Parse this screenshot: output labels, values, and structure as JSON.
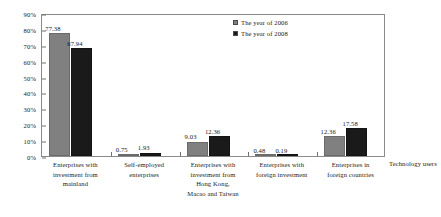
{
  "chart_data": {
    "type": "bar",
    "title": "",
    "subtitle": "",
    "xlabel": "Technology users",
    "ylabel": "",
    "ylim": [
      0,
      90
    ],
    "ytick_labels": [
      "0%",
      "10%",
      "20%",
      "30%",
      "40%",
      "50%",
      "60%",
      "70%",
      "80%",
      "90%"
    ],
    "ytick_values": [
      0,
      10,
      20,
      30,
      40,
      50,
      60,
      70,
      80,
      90
    ],
    "grid": false,
    "legend_position": "top-right",
    "categories": [
      "Enterprises with investment from mainland",
      "Self-employed enterprises",
      "Enterprises with investment from Hong Kong, Macao and Taiwan",
      "Enterprises with foreign investment",
      "Enterprises in foreign countries"
    ],
    "category_lines": [
      [
        "Enterprises with",
        "investment from",
        "mainland"
      ],
      [
        "Self-employed",
        "enterprises"
      ],
      [
        "Enterprises with",
        "investment from",
        "Hong Kong,",
        "Macao and Taiwan"
      ],
      [
        "Enterprises with",
        "foreign investment"
      ],
      [
        "Enterprises in",
        "foreign countries"
      ]
    ],
    "series": [
      {
        "name": "The year of 2006",
        "color": "#808080",
        "values": [
          77.38,
          0.75,
          9.03,
          0.48,
          12.36
        ],
        "labels": [
          "77.38",
          "0.75",
          "9.03",
          "0.48",
          "12.36"
        ]
      },
      {
        "name": "The year of 2008",
        "color": "#1a1a1a",
        "values": [
          67.94,
          1.93,
          12.36,
          0.19,
          17.58
        ],
        "labels": [
          "67.94",
          "1.93",
          "12.36",
          "0.19",
          "17.58"
        ]
      }
    ]
  },
  "legend": {
    "items": [
      {
        "label": "The year of 2006",
        "swatch": "legend-swatch-2006"
      },
      {
        "label": "The year of 2008",
        "swatch": "legend-swatch-2008"
      }
    ]
  },
  "axis": {
    "x_title": "Technology users"
  }
}
